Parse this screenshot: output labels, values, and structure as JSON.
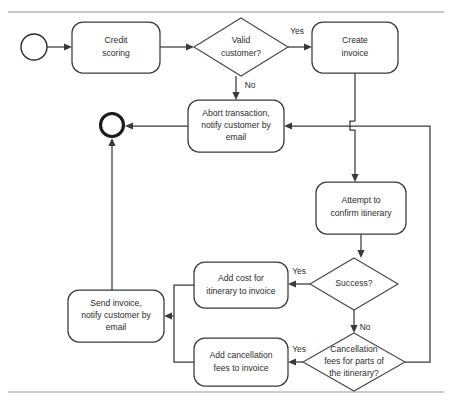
{
  "diagram": {
    "type": "flowchart",
    "background_color": "#ffffff",
    "line_color": "#3a3a3a",
    "text_color": "#2d2d2d",
    "rule_color": "#b9b9b9",
    "nodes": [
      {
        "id": "start",
        "kind": "start-event",
        "label": "",
        "lines": [],
        "cx": 34,
        "cy": 47,
        "r": 13
      },
      {
        "id": "credit-scoring",
        "kind": "task",
        "label": "Credit scoring",
        "lines": [
          "Credit",
          "scoring"
        ],
        "x": 72,
        "y": 22,
        "w": 88,
        "h": 51
      },
      {
        "id": "valid-customer",
        "kind": "decision",
        "label": "Valid customer?",
        "lines": [
          "Valid",
          "customer?"
        ],
        "cx": 241,
        "cy": 47,
        "rx": 47,
        "ry": 29
      },
      {
        "id": "create-invoice",
        "kind": "task",
        "label": "Create invoice",
        "lines": [
          "Create",
          "invoice"
        ],
        "x": 312,
        "y": 22,
        "w": 86,
        "h": 51
      },
      {
        "id": "abort-transaction",
        "kind": "task",
        "label": "Abort transaction, notify customer by email",
        "lines": [
          "Abort transaction,",
          "notify customer by",
          "email"
        ],
        "x": 188,
        "y": 100,
        "w": 96,
        "h": 52
      },
      {
        "id": "end",
        "kind": "end-event",
        "label": "",
        "lines": [],
        "cx": 112,
        "cy": 125,
        "r": 12.5
      },
      {
        "id": "attempt-confirm",
        "kind": "task",
        "label": "Attempt to confirm itinerary",
        "lines": [
          "Attempt to",
          "confirm itinerary"
        ],
        "x": 316,
        "y": 182,
        "w": 90,
        "h": 52
      },
      {
        "id": "success",
        "kind": "decision",
        "label": "Success?",
        "lines": [
          "Success?"
        ],
        "cx": 354,
        "cy": 284,
        "rx": 44,
        "ry": 26
      },
      {
        "id": "cancellation-fees",
        "kind": "decision",
        "label": "Cancellation fees for parts of the itinerary?",
        "lines": [
          "Cancellation",
          "fees for parts of",
          "the itinerary?"
        ],
        "cx": 354,
        "cy": 362,
        "rx": 51,
        "ry": 29
      },
      {
        "id": "add-cost",
        "kind": "task",
        "label": "Add cost for itinerary to invoice",
        "lines": [
          "Add cost for",
          "itinerary to invoice"
        ],
        "x": 194,
        "y": 262,
        "w": 94,
        "h": 46
      },
      {
        "id": "add-cancellation",
        "kind": "task",
        "label": "Add cancellation fees to invoice",
        "lines": [
          "Add cancellation",
          "fees to invoice"
        ],
        "x": 194,
        "y": 338,
        "w": 94,
        "h": 48
      },
      {
        "id": "send-invoice",
        "kind": "task",
        "label": "Send invoice, notify customer by email",
        "lines": [
          "Send invoice,",
          "notify customer by",
          "email"
        ],
        "x": 68,
        "y": 290,
        "w": 96,
        "h": 52
      }
    ],
    "edge_labels": [
      {
        "id": "valid-yes",
        "text": "Yes",
        "x": 297,
        "y": 32
      },
      {
        "id": "valid-no",
        "text": "No",
        "x": 250,
        "y": 86
      },
      {
        "id": "success-yes",
        "text": "Yes",
        "x": 299,
        "y": 272
      },
      {
        "id": "success-no",
        "text": "No",
        "x": 365,
        "y": 328
      },
      {
        "id": "cancel-yes",
        "text": "Yes",
        "x": 299,
        "y": 350
      }
    ],
    "rules": [
      {
        "id": "top-rule",
        "y": 12
      },
      {
        "id": "bottom-rule",
        "y": 392
      }
    ]
  }
}
